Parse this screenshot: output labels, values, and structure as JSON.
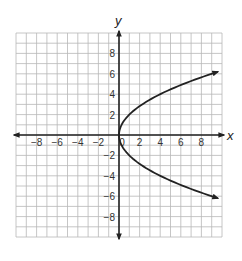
{
  "chart_data": {
    "type": "line",
    "title": "",
    "xlabel": "x",
    "ylabel": "y",
    "xlim": [
      -10,
      10
    ],
    "ylim": [
      -10,
      10
    ],
    "grid": true,
    "grid_step": 1,
    "x_ticks": [
      -8,
      -6,
      -4,
      -2,
      0,
      2,
      4,
      6,
      8
    ],
    "y_ticks": [
      -8,
      -6,
      -4,
      -2,
      2,
      4,
      6,
      8
    ],
    "x_tick_labels": [
      "-8",
      "-6",
      "-4",
      "-2",
      "0",
      "2",
      "4",
      "6",
      "8"
    ],
    "y_tick_labels": [
      "-8",
      "-6",
      "-4",
      "-2",
      "2",
      "4",
      "6",
      "8"
    ],
    "legend": null,
    "series": [
      {
        "name": "sideways parabola x = y^2/4",
        "equation": "x = y^2 / 4",
        "color": "#222222",
        "arrows": [
          "upper-right end",
          "lower-right end"
        ],
        "points": [
          {
            "x": 9.5,
            "y": -6.2
          },
          {
            "x": 6,
            "y": -4.9
          },
          {
            "x": 4,
            "y": -4
          },
          {
            "x": 2,
            "y": -2.8
          },
          {
            "x": 1,
            "y": -2
          },
          {
            "x": 0.25,
            "y": -1
          },
          {
            "x": 0,
            "y": 0
          },
          {
            "x": 0.25,
            "y": 1
          },
          {
            "x": 1,
            "y": 2
          },
          {
            "x": 2,
            "y": 2.8
          },
          {
            "x": 4,
            "y": 4
          },
          {
            "x": 6,
            "y": 4.9
          },
          {
            "x": 9.5,
            "y": 6.2
          }
        ]
      }
    ]
  },
  "colors": {
    "grid": "#b8b8b8",
    "axis": "#222222",
    "curve": "#222222",
    "background": "#ffffff"
  }
}
